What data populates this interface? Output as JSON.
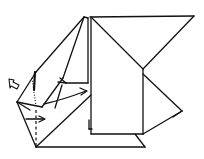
{
  "diagram": {
    "type": "origami-fold-instruction",
    "background": "#ffffff",
    "line_color": "#111111",
    "annotations": [
      {
        "kind": "push-arrow",
        "position": "left",
        "meaning": "push in"
      },
      {
        "kind": "fold-arrow",
        "position": "center",
        "meaning": "fold flap to the right"
      },
      {
        "kind": "fold-arrow",
        "position": "lower-left",
        "meaning": "fold along dashed line to the right"
      },
      {
        "kind": "valley-fold-line",
        "style": "dashed"
      },
      {
        "kind": "mountain-fold-line",
        "style": "dotted"
      }
    ]
  }
}
